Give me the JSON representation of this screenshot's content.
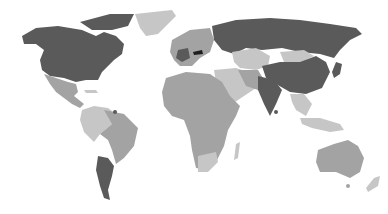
{
  "map": {
    "type": "choropleth-world",
    "background": "#ffffff",
    "palette": {
      "darkest": "#1e1e1e",
      "dark": "#5a5a5a",
      "medium": "#a3a3a3",
      "light": "#c6c6c6"
    },
    "regions": [
      {
        "name": "north-america-usa-canada",
        "shade": "dark"
      },
      {
        "name": "greenland",
        "shade": "light"
      },
      {
        "name": "mexico-central-america",
        "shade": "medium"
      },
      {
        "name": "south-america-north",
        "shade": "light"
      },
      {
        "name": "brazil",
        "shade": "medium"
      },
      {
        "name": "argentina",
        "shade": "dark"
      },
      {
        "name": "europe-west",
        "shade": "medium"
      },
      {
        "name": "france",
        "shade": "dark"
      },
      {
        "name": "austria",
        "shade": "darkest"
      },
      {
        "name": "russia",
        "shade": "dark"
      },
      {
        "name": "central-asia",
        "shade": "light"
      },
      {
        "name": "mongolia",
        "shade": "light"
      },
      {
        "name": "china",
        "shade": "dark"
      },
      {
        "name": "india",
        "shade": "dark"
      },
      {
        "name": "middle-east",
        "shade": "light"
      },
      {
        "name": "africa",
        "shade": "medium"
      },
      {
        "name": "south-africa",
        "shade": "light"
      },
      {
        "name": "madagascar",
        "shade": "light"
      },
      {
        "name": "southeast-asia",
        "shade": "light"
      },
      {
        "name": "japan",
        "shade": "dark"
      },
      {
        "name": "australia",
        "shade": "medium"
      },
      {
        "name": "new-zealand",
        "shade": "light"
      }
    ]
  }
}
